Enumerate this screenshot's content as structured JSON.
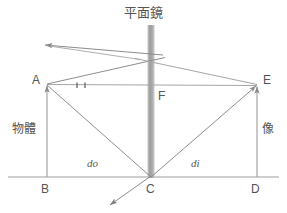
{
  "diagram": {
    "title": "平面鏡",
    "colors": {
      "mirror": "#9a9a9a",
      "ray": "#8a8a8a",
      "construction": "#a8a8a8",
      "baseline": "#999999",
      "text": "#555555",
      "background": "#ffffff"
    },
    "labels": {
      "point_A": "A",
      "point_B": "B",
      "point_C": "C",
      "point_D": "D",
      "point_E": "E",
      "point_F": "F",
      "object": "物體",
      "image": "像",
      "distance_object": "do",
      "distance_image": "di"
    },
    "geometry": {
      "mirror": {
        "x": 151,
        "y_top": 25,
        "y_bottom": 178,
        "width": 7
      },
      "baseline": {
        "x1": 8,
        "x2": 279,
        "y": 177
      },
      "point_A": {
        "x": 47,
        "y": 84
      },
      "point_B": {
        "x": 47,
        "y": 177
      },
      "point_C": {
        "x": 151,
        "y": 177
      },
      "point_D": {
        "x": 257,
        "y": 177
      },
      "point_E": {
        "x": 257,
        "y": 85
      },
      "point_F": {
        "x": 151,
        "y": 84
      },
      "incident_ray_hit": {
        "x": 151,
        "y": 63
      },
      "reflected_ray_end": {
        "x": 45,
        "y": 45
      },
      "refracted_ray_end": {
        "x": 110,
        "y": 205
      },
      "tick_marks": [
        {
          "x": 77,
          "y": 85
        },
        {
          "x": 85,
          "y": 85
        }
      ]
    }
  }
}
